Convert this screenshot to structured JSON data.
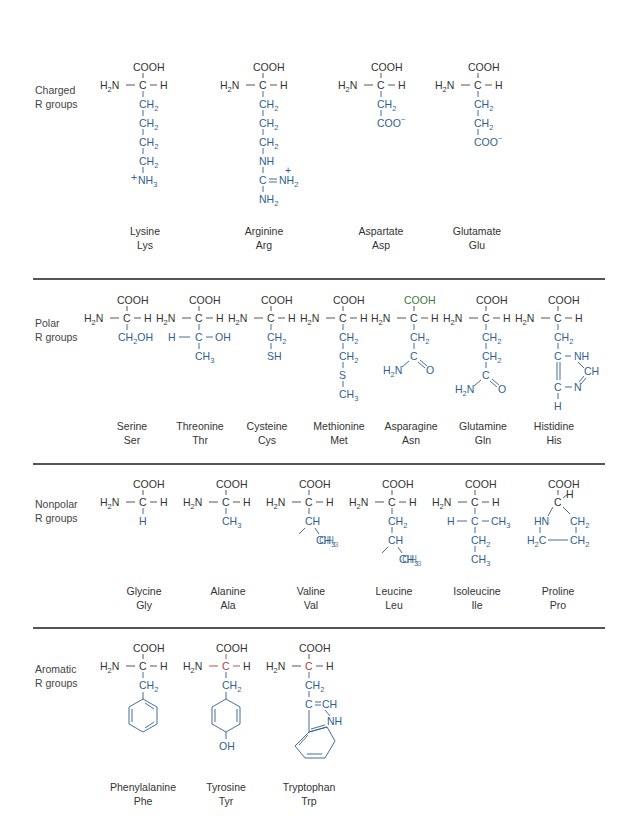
{
  "colors": {
    "backbone": "#333333",
    "side_chain": "#2f5f8f",
    "separator": "#555555"
  },
  "groups": [
    {
      "label_line1": "Charged",
      "label_line2": "R groups",
      "amino_acids": [
        {
          "name": "Lysine",
          "abbr": "Lys",
          "side_chain": [
            "CH2",
            "CH2",
            "CH2",
            "CH2",
            "+NH3"
          ]
        },
        {
          "name": "Arginine",
          "abbr": "Arg",
          "side_chain": [
            "CH2",
            "CH2",
            "CH2",
            "NH",
            "C=NH2+",
            "NH2"
          ]
        },
        {
          "name": "Aspartate",
          "abbr": "Asp",
          "side_chain": [
            "CH2",
            "COO-"
          ]
        },
        {
          "name": "Glutamate",
          "abbr": "Glu",
          "side_chain": [
            "CH2",
            "CH2",
            "COO-"
          ]
        }
      ]
    },
    {
      "label_line1": "Polar",
      "label_line2": "R groups",
      "amino_acids": [
        {
          "name": "Serine",
          "abbr": "Ser",
          "side_chain": [
            "CH2OH"
          ]
        },
        {
          "name": "Threonine",
          "abbr": "Thr",
          "side_chain": [
            "H-C-OH",
            "CH3"
          ]
        },
        {
          "name": "Cysteine",
          "abbr": "Cys",
          "side_chain": [
            "CH2",
            "SH"
          ]
        },
        {
          "name": "Methionine",
          "abbr": "Met",
          "side_chain": [
            "CH2",
            "CH2",
            "S",
            "CH3"
          ]
        },
        {
          "name": "Asparagine",
          "abbr": "Asn",
          "side_chain": [
            "CH2",
            "C(=O)NH2"
          ]
        },
        {
          "name": "Glutamine",
          "abbr": "Gln",
          "side_chain": [
            "CH2",
            "CH2",
            "C(=O)NH2"
          ]
        },
        {
          "name": "Histidine",
          "abbr": "His",
          "side_chain": [
            "CH2",
            "imidazole"
          ]
        }
      ]
    },
    {
      "label_line1": "Nonpolar",
      "label_line2": "R groups",
      "amino_acids": [
        {
          "name": "Glycine",
          "abbr": "Gly",
          "side_chain": [
            "H"
          ]
        },
        {
          "name": "Alanine",
          "abbr": "Ala",
          "side_chain": [
            "CH3"
          ]
        },
        {
          "name": "Valine",
          "abbr": "Val",
          "side_chain": [
            "CH",
            "CH3",
            "CH3"
          ]
        },
        {
          "name": "Leucine",
          "abbr": "Leu",
          "side_chain": [
            "CH2",
            "CH",
            "CH3",
            "CH3"
          ]
        },
        {
          "name": "Isoleucine",
          "abbr": "Ile",
          "side_chain": [
            "H-C-CH3",
            "CH2",
            "CH3"
          ]
        },
        {
          "name": "Proline",
          "abbr": "Pro",
          "side_chain": [
            "pyrrolidine"
          ]
        }
      ]
    },
    {
      "label_line1": "Aromatic",
      "label_line2": "R groups",
      "amino_acids": [
        {
          "name": "Phenylalanine",
          "abbr": "Phe",
          "side_chain": [
            "CH2",
            "benzene"
          ]
        },
        {
          "name": "Tyrosine",
          "abbr": "Tyr",
          "side_chain": [
            "CH2",
            "phenol",
            "OH"
          ]
        },
        {
          "name": "Tryptophan",
          "abbr": "Trp",
          "side_chain": [
            "CH2",
            "indole"
          ]
        }
      ]
    }
  ],
  "atoms": {
    "cooh": "COOH",
    "h2n": "H",
    "h2n_sub": "2",
    "n": "N",
    "c": "C",
    "h": "H",
    "ch": "CH",
    "ch2": "CH",
    "ch3": "CH",
    "sub2": "2",
    "sub3": "3",
    "nh": "NH",
    "nh3": "NH",
    "nh2": "NH",
    "coo": "COO",
    "minus": "−",
    "plus": "+",
    "oh": "OH",
    "sh": "SH",
    "s": "S",
    "o": "O",
    "hn": "HN",
    "ch2oh": "CH",
    "ch2oh_tail": "OH",
    "dash": "−",
    "eq": "="
  }
}
